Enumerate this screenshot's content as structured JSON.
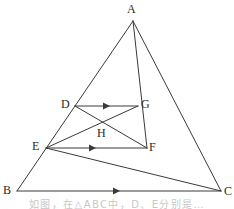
{
  "figure": {
    "stroke_color": "#3a3a3a",
    "background_color": "#ffffff",
    "label_color": "#2b2b2b",
    "stroke_width": 1,
    "width": 234,
    "height": 209,
    "points": {
      "A": {
        "label": "A",
        "x": 133,
        "y": 21,
        "label_x": 127,
        "label_y": 4
      },
      "B": {
        "label": "B",
        "x": 17,
        "y": 191,
        "label_x": 3,
        "label_y": 186
      },
      "C": {
        "label": "C",
        "x": 221,
        "y": 191,
        "label_x": 224,
        "label_y": 187
      },
      "D": {
        "label": "D",
        "x": 75,
        "y": 106,
        "label_x": 61,
        "label_y": 99
      },
      "E": {
        "label": "E",
        "x": 46,
        "y": 148,
        "label_x": 32,
        "label_y": 141
      },
      "F": {
        "label": "F",
        "x": 147,
        "y": 148,
        "label_x": 149,
        "label_y": 142
      },
      "G": {
        "label": "G",
        "x": 138,
        "y": 106,
        "label_x": 141,
        "label_y": 99
      },
      "H": {
        "label": "H",
        "x": 102,
        "y": 125,
        "label_x": 97,
        "label_y": 128
      }
    },
    "segments": [
      {
        "name": "AB",
        "from": "A",
        "to": "B",
        "arrow": false
      },
      {
        "name": "AC",
        "from": "A",
        "to": "C",
        "arrow": false
      },
      {
        "name": "BC",
        "from": "B",
        "to": "C",
        "arrow": true,
        "arrow_at": 0.5
      },
      {
        "name": "AF",
        "from": "A",
        "to": "F",
        "arrow": false
      },
      {
        "name": "DG",
        "from": "D",
        "to": "G",
        "arrow": true,
        "arrow_at": 0.56
      },
      {
        "name": "EF",
        "from": "E",
        "to": "F",
        "arrow": true,
        "arrow_at": 0.5
      },
      {
        "name": "DF",
        "from": "D",
        "to": "F",
        "arrow": false
      },
      {
        "name": "EG",
        "from": "E",
        "to": "G",
        "arrow": false
      },
      {
        "name": "EC",
        "from": "E",
        "to": "C",
        "arrow": false
      }
    ],
    "arrow_marks": [
      {
        "name": "arrow-dg",
        "x": 110,
        "y": 106,
        "direction": "right"
      },
      {
        "name": "arrow-ef",
        "x": 96,
        "y": 148,
        "direction": "right"
      },
      {
        "name": "arrow-bc",
        "x": 120,
        "y": 191,
        "direction": "right"
      }
    ]
  },
  "caption": {
    "text": "如图，在△ABC中，D、E分别是…"
  }
}
